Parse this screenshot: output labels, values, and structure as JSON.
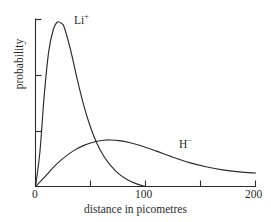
{
  "figure": {
    "background_color": "#ffffff",
    "ink_color": "#2b2b2b"
  },
  "chart_data": {
    "type": "line",
    "title": "",
    "xlabel": "distance in picometres",
    "ylabel": "probability",
    "xlim": [
      0,
      200
    ],
    "ylim": [
      0,
      1
    ],
    "grid": false,
    "legend_position": "inline-annotation",
    "x_ticks": [
      0,
      50,
      100,
      150,
      200
    ],
    "x_tick_labels": [
      "0",
      "",
      "100",
      "",
      "200"
    ],
    "y_ticks": [
      0.0,
      0.5,
      1.0
    ],
    "y_tick_labels": [
      "",
      "",
      ""
    ],
    "annotations": [
      {
        "text": "Li",
        "charge": "+",
        "x": 42,
        "y": 0.93
      },
      {
        "text": "H",
        "charge": "−",
        "x": 143,
        "y": 0.3
      }
    ],
    "series": [
      {
        "name": "Li+",
        "label": "Li⁺",
        "x": [
          0,
          4,
          8,
          12,
          16,
          20,
          24,
          26,
          30,
          34,
          38,
          44,
          50,
          56,
          62,
          68,
          76,
          84,
          92,
          100
        ],
        "values": [
          0.0,
          0.21,
          0.56,
          0.82,
          0.95,
          1.0,
          0.99,
          0.97,
          0.88,
          0.77,
          0.65,
          0.49,
          0.36,
          0.26,
          0.185,
          0.13,
          0.075,
          0.04,
          0.016,
          0.0
        ]
      },
      {
        "name": "H-",
        "label": "H⁻",
        "x": [
          0,
          8,
          16,
          24,
          34,
          44,
          54,
          62,
          68,
          76,
          86,
          96,
          110,
          125,
          140,
          155,
          170,
          185,
          200
        ],
        "values": [
          0.0,
          0.055,
          0.115,
          0.165,
          0.215,
          0.25,
          0.272,
          0.281,
          0.283,
          0.279,
          0.266,
          0.248,
          0.215,
          0.178,
          0.145,
          0.12,
          0.101,
          0.089,
          0.082
        ]
      }
    ]
  }
}
